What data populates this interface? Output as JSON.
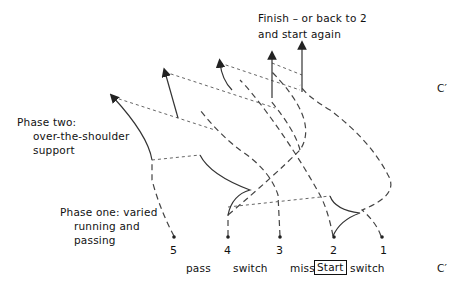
{
  "labels": {
    "finish_line1": "Finish – or back to 2",
    "finish_line2": "and start again",
    "phase_two_title": "Phase two:",
    "phase_two_line2": "over-the-shoulder",
    "phase_two_line3": "support",
    "phase_one_line1": "Phase one: varied",
    "phase_one_line2": "running and",
    "phase_one_line3": "passing",
    "c_prime_top": "C′",
    "c_prime_bottom": "C′"
  },
  "positions": [
    "5",
    "4",
    "3",
    "2",
    "1"
  ],
  "actions": {
    "pass": "pass",
    "switch1": "switch",
    "miss": "miss",
    "start": "Start",
    "switch2": "switch"
  },
  "colors": {
    "line": "#333333",
    "dashed": "#555555"
  }
}
